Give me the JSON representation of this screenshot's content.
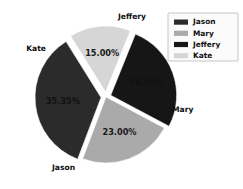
{
  "chart_data": {
    "type": "pie",
    "title": "",
    "categories": [
      "Jason",
      "Mary",
      "Jeffery",
      "Kate"
    ],
    "values": [
      35.35,
      23.0,
      26.65,
      15.0
    ],
    "value_labels": [
      "35.35%",
      "23.00%",
      "26.65%",
      "15.00%"
    ],
    "colors": [
      "#2b2b2b",
      "#aaaaaa",
      "#161616",
      "#d6d6d6"
    ],
    "exploded": [
      true,
      false,
      true,
      true
    ],
    "legend_position": "top-right",
    "grid": false,
    "unit": "percent"
  },
  "legend": {
    "items": [
      {
        "label": "Jason",
        "color": "#2b2b2b"
      },
      {
        "label": "Mary",
        "color": "#aaaaaa"
      },
      {
        "label": "Jeffery",
        "color": "#161616"
      },
      {
        "label": "Kate",
        "color": "#d6d6d6"
      }
    ]
  },
  "slices": {
    "jeffery": {
      "name": "Jeffery",
      "pct": "26.65%",
      "color": "#161616"
    },
    "mary": {
      "name": "Mary",
      "pct": "23.00%",
      "color": "#aaaaaa"
    },
    "jason": {
      "name": "Jason",
      "pct": "35.35%",
      "color": "#2b2b2b"
    },
    "kate": {
      "name": "Kate",
      "pct": "15.00%",
      "color": "#d6d6d6"
    }
  }
}
